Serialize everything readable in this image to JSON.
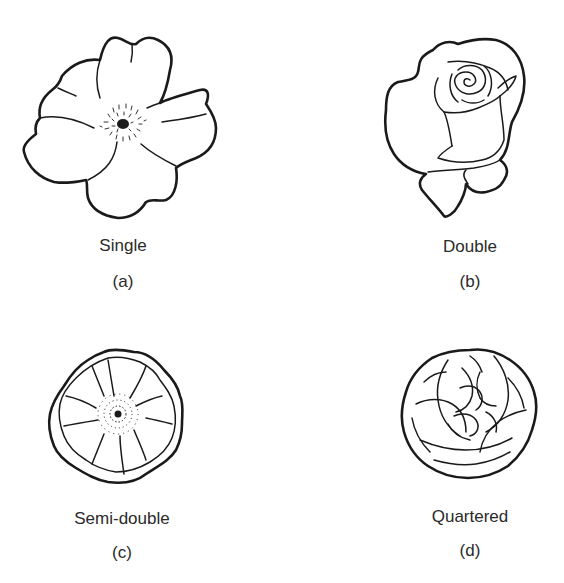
{
  "figure": {
    "panels": [
      {
        "id": "a",
        "name": "Single",
        "letter": "(a)"
      },
      {
        "id": "b",
        "name": "Double",
        "letter": "(b)"
      },
      {
        "id": "c",
        "name": "Semi-double",
        "letter": "(c)"
      },
      {
        "id": "d",
        "name": "Quartered",
        "letter": "(d)"
      }
    ],
    "colors": {
      "line": "#1a1a1a",
      "background": "#ffffff",
      "text": "#2a2a2a"
    }
  }
}
